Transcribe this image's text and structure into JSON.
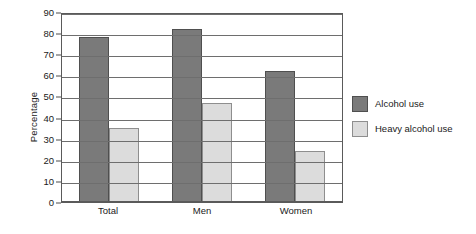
{
  "chart_data": {
    "type": "bar",
    "title": "",
    "xlabel": "",
    "ylabel": "Percentage",
    "categories": [
      "Total",
      "Men",
      "Women"
    ],
    "series": [
      {
        "name": "Alcohol use",
        "color": "#7a7a7a",
        "values": [
          78,
          82,
          62
        ]
      },
      {
        "name": "Heavy alcohol use",
        "color": "#dcdcdc",
        "values": [
          35,
          47,
          24
        ]
      }
    ],
    "ylim": [
      0,
      90
    ],
    "ytick_step": 10,
    "yticks": [
      0,
      10,
      20,
      30,
      40,
      50,
      60,
      70,
      80,
      90
    ],
    "grid": true,
    "legend_position": "right"
  },
  "legend": {
    "items": [
      {
        "label": "Alcohol use"
      },
      {
        "label": "Heavy alcohol use"
      }
    ]
  }
}
